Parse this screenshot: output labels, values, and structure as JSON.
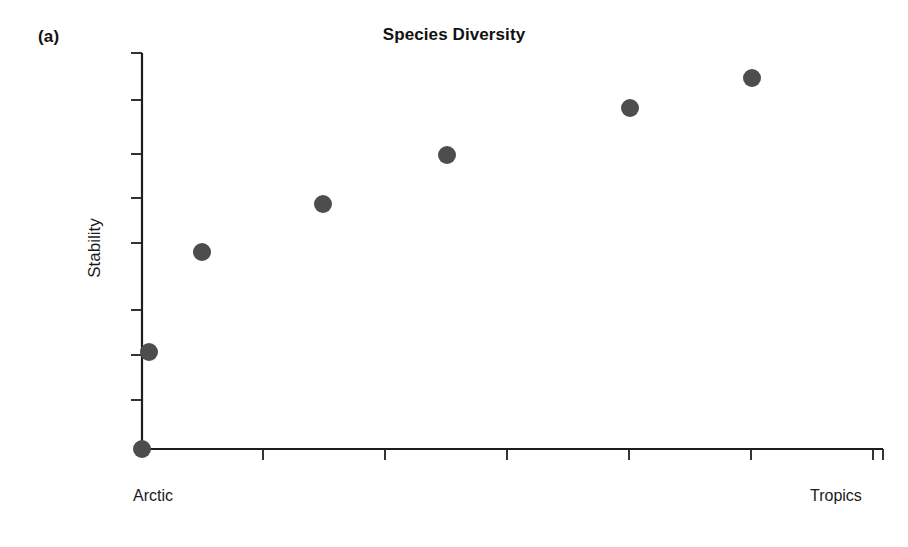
{
  "figure": {
    "panel_label": "(a)",
    "background_color": "#ffffff"
  },
  "chart_data": {
    "type": "scatter",
    "title": "Species Diversity",
    "xlabel": "Species Diversity",
    "ylabel": "Stability",
    "x_tick_labels": [
      "Arctic",
      "Tropics"
    ],
    "x_tick_label_left": "Arctic",
    "x_tick_label_right": "Tropics",
    "grid": false,
    "legend": null,
    "xlim": [
      0,
      6
    ],
    "ylim": [
      0,
      9
    ],
    "axis": {
      "x_axis_pixel_y": 449,
      "y_axis_pixel_x": 142,
      "x_tick_pixels": [
        142,
        263,
        385,
        507,
        629,
        751,
        873
      ],
      "y_tick_pixels": [
        53,
        100,
        154,
        198,
        243,
        310,
        355,
        400
      ],
      "x_ticks_count": 7,
      "y_ticks_count": 8
    },
    "marker": {
      "color": "#4d4d4d",
      "shape": "circle",
      "radius_px": 9
    },
    "x": [
      0,
      0.06,
      0.5,
      1.5,
      2.5,
      4.0,
      5.0
    ],
    "y": [
      0,
      2.2,
      4.45,
      5.55,
      6.65,
      7.75,
      8.4
    ],
    "points": [
      {
        "label": "p1",
        "cx": 142,
        "cy": 449
      },
      {
        "label": "p2",
        "cx": 149,
        "cy": 352
      },
      {
        "label": "p3",
        "cx": 202,
        "cy": 252
      },
      {
        "label": "p4",
        "cx": 323,
        "cy": 204
      },
      {
        "label": "p5",
        "cx": 447,
        "cy": 155
      },
      {
        "label": "p6",
        "cx": 630,
        "cy": 108
      },
      {
        "label": "p7",
        "cx": 752,
        "cy": 78
      }
    ],
    "annotations": [
      "(a)"
    ]
  }
}
